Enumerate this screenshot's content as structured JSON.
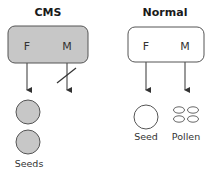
{
  "panels": {
    "cms": {
      "title": "CMS",
      "female_label": "F",
      "male_label": "M",
      "box_fill": "#c7c7c7",
      "male_blocked": true,
      "output_label": "Seeds",
      "seed_fill": "#c7c7c7",
      "seed_count": 2
    },
    "normal": {
      "title": "Normal",
      "female_label": "F",
      "male_label": "M",
      "box_fill": "#ffffff",
      "male_blocked": false,
      "seed_label": "Seed",
      "pollen_label": "Pollen",
      "pollen_count": 4
    }
  },
  "colors": {
    "stroke": "#555555",
    "text": "#333333"
  }
}
